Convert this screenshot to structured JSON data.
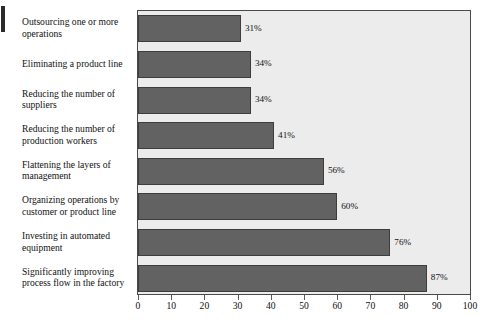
{
  "chart_data": {
    "type": "bar",
    "orientation": "horizontal",
    "title": "",
    "subtitle": "",
    "xlabel": "",
    "ylabel": "",
    "xlim": [
      0,
      100
    ],
    "xticks": [
      0,
      10,
      20,
      30,
      40,
      50,
      60,
      70,
      80,
      90,
      100
    ],
    "xtick_labels": [
      "0",
      "10",
      "20",
      "30",
      "40",
      "50",
      "60",
      "70",
      "80",
      "90",
      "100"
    ],
    "grid": false,
    "legend": null,
    "value_suffix": "%",
    "categories": [
      "Outsourcing one or more operations",
      "Eliminating a product line",
      "Reducing the number of suppliers",
      "Reducing the number of production workers",
      "Flattening the layers of management",
      "Organizing operations by customer or product line",
      "Investing in automated equipment",
      "Significantly improving process flow in the factory"
    ],
    "values": [
      31,
      34,
      34,
      41,
      56,
      60,
      76,
      87
    ],
    "value_labels": [
      "31%",
      "34%",
      "34%",
      "41%",
      "56%",
      "60%",
      "76%",
      "87%"
    ],
    "colors": {
      "bar_fill": "#626262",
      "bar_border": "#3d3d3d",
      "plot_background": "#ececec",
      "plot_border": "#4a4a4a",
      "page_background": "#ffffff",
      "text": "#111111"
    }
  }
}
